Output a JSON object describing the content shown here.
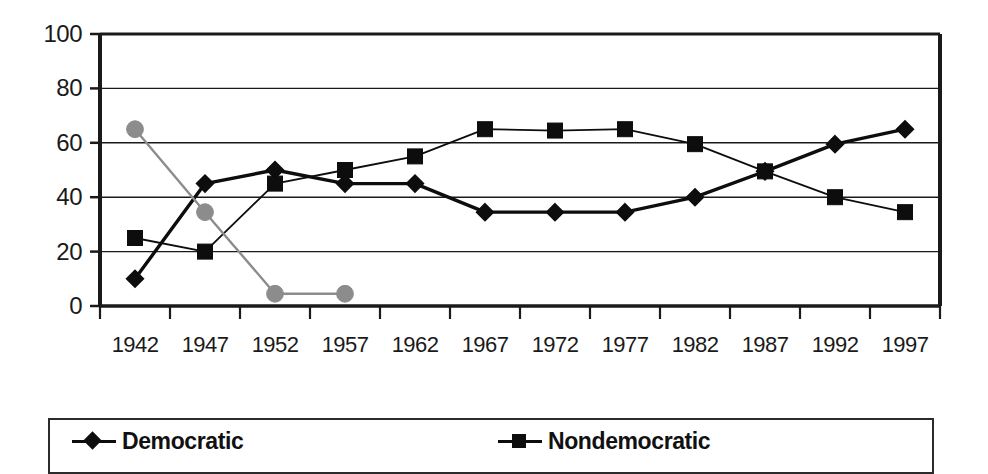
{
  "chart_data": {
    "type": "line",
    "title": "",
    "subtitle": "",
    "xlabel": "",
    "ylabel": "",
    "categories": [
      "1942",
      "1947",
      "1952",
      "1957",
      "1962",
      "1967",
      "1972",
      "1977",
      "1982",
      "1987",
      "1992",
      "1997"
    ],
    "ylim": [
      0,
      100
    ],
    "y_ticks": [
      0,
      20,
      40,
      60,
      80,
      100
    ],
    "grid": "horizontal",
    "legend_position": "bottom",
    "series": [
      {
        "name": "Democratic",
        "marker": "diamond",
        "color": "#0d0d0d",
        "values": [
          10,
          45,
          50,
          45,
          45,
          34.5,
          34.5,
          34.5,
          40,
          49.5,
          59.5,
          65
        ]
      },
      {
        "name": "Nondemocratic",
        "marker": "square",
        "color": "#0d0d0d",
        "values": [
          25,
          20,
          45,
          50,
          55,
          65,
          64.5,
          65,
          59.5,
          49.5,
          40,
          34.5
        ]
      },
      {
        "name": "",
        "marker": "circle",
        "color": "#8c8c8c",
        "values": [
          65,
          34.5,
          4.5,
          4.5,
          null,
          null,
          null,
          null,
          null,
          null,
          null,
          null
        ]
      }
    ]
  },
  "legend": {
    "entries": [
      {
        "label": "Democratic",
        "marker": "diamond-marker-icon"
      },
      {
        "label": "Nondemocratic",
        "marker": "square-marker-icon"
      }
    ]
  }
}
